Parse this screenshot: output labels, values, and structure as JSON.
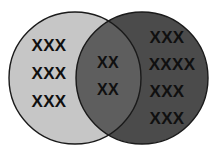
{
  "figure": {
    "kind": "venn-diagram",
    "background_color": "#ffffff",
    "outline_color": "#1a1a1a",
    "outline_width": 1.4,
    "canvas": {
      "width": 217,
      "height": 155
    }
  },
  "sets": {
    "left": {
      "name": "left-set",
      "fill_color": "#c6c6c6",
      "center_x": 75,
      "center_y": 78,
      "radius": 66,
      "rows": [
        {
          "text": "XXX",
          "x": 49,
          "y": 51
        },
        {
          "text": "XXX",
          "x": 49,
          "y": 79
        },
        {
          "text": "XXX",
          "x": 49,
          "y": 107
        }
      ]
    },
    "right": {
      "name": "right-set",
      "fill_color": "#4b4b4b",
      "center_x": 142,
      "center_y": 78,
      "radius": 66,
      "rows": [
        {
          "text": "XXX",
          "x": 167,
          "y": 43
        },
        {
          "text": "XXXX",
          "x": 172,
          "y": 70
        },
        {
          "text": "XXX",
          "x": 167,
          "y": 97
        },
        {
          "text": "XXX",
          "x": 167,
          "y": 124
        }
      ]
    },
    "intersection": {
      "name": "intersection-set",
      "fill_color": "#5e5e5e",
      "rows": [
        {
          "text": "XX",
          "x": 108,
          "y": 68
        },
        {
          "text": "XX",
          "x": 108,
          "y": 95
        }
      ]
    }
  }
}
